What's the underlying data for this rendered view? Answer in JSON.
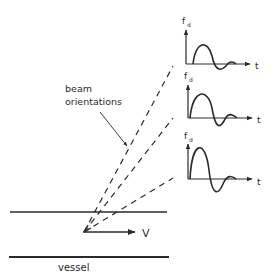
{
  "labels": {
    "beam_line1": "beam",
    "beam_line2": "orientations",
    "vessel": "vessel",
    "velocity": "V"
  },
  "graphs": [
    {
      "y_label": "f",
      "y_sub": "d",
      "x_label": "t"
    },
    {
      "y_label": "f",
      "y_sub": "d",
      "x_label": "t"
    },
    {
      "y_label": "f",
      "y_sub": "d",
      "x_label": "t"
    }
  ],
  "colors": {
    "ink": "#2a2a2a",
    "background": "#ffffff"
  }
}
